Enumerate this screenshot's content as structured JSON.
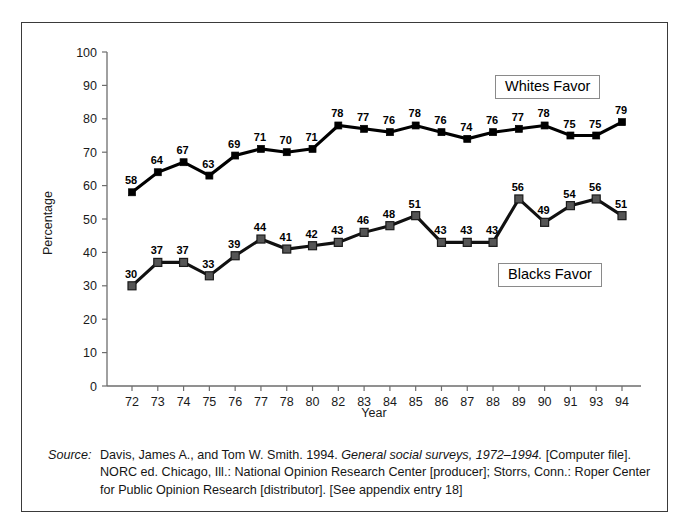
{
  "chart_data": {
    "type": "line",
    "title": "",
    "subtitle": "",
    "xlabel": "Year",
    "ylabel": "Percentage",
    "ylim": [
      0,
      100
    ],
    "ytick_step": 10,
    "yticks": [
      0,
      10,
      20,
      30,
      40,
      50,
      60,
      70,
      80,
      90,
      100
    ],
    "grid": false,
    "legend_position": "inside-right",
    "categories": [
      "72",
      "73",
      "74",
      "75",
      "76",
      "77",
      "78",
      "80",
      "82",
      "83",
      "84",
      "85",
      "86",
      "87",
      "88",
      "89",
      "90",
      "91",
      "93",
      "94"
    ],
    "series": [
      {
        "name": "Whites Favor",
        "marker": "filled-square-black",
        "color": "#000000",
        "values": [
          58,
          64,
          67,
          63,
          69,
          71,
          70,
          71,
          78,
          77,
          76,
          78,
          76,
          74,
          76,
          77,
          78,
          75,
          75,
          79
        ]
      },
      {
        "name": "Blacks Favor",
        "marker": "filled-square-gray",
        "color": "#555555",
        "values": [
          30,
          37,
          37,
          33,
          39,
          44,
          41,
          42,
          43,
          46,
          48,
          51,
          43,
          43,
          43,
          56,
          49,
          54,
          56,
          51
        ]
      }
    ]
  },
  "legend": {
    "whites_label": "Whites Favor",
    "blacks_label": "Blacks Favor"
  },
  "source": {
    "label": "Source:",
    "line1_pre": "Davis, James A., and Tom W. Smith. 1994. ",
    "line1_italic": "General social surveys, 1972–1994.",
    "line1_post": " [Computer file].",
    "line2": "NORC ed. Chicago, Ill.: National Opinion Research Center [producer]; Storrs, Conn.: Roper Center",
    "line3": "for Public Opinion Research [distributor]. [See appendix entry 18]"
  }
}
